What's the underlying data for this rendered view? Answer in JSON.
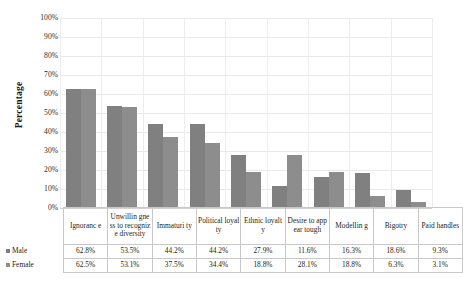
{
  "chart_data": {
    "type": "bar",
    "title": "",
    "xlabel": "",
    "ylabel": "Percentage",
    "ylim": [
      0,
      100
    ],
    "ytick_labels": [
      "100%",
      "90%",
      "80%",
      "70%",
      "60%",
      "50%",
      "40%",
      "30%",
      "20%",
      "10%",
      "0%"
    ],
    "ytick_values": [
      100,
      90,
      80,
      70,
      60,
      50,
      40,
      30,
      20,
      10,
      0
    ],
    "grid": true,
    "legend_position": "data-table-first-column",
    "categories": [
      "Ignoranc e",
      "Unwillin gness to recognize diversity",
      "Immaturi ty",
      "Political loyalty",
      "Ethnic loyalty",
      "Desire to appear tough",
      "Modellin g",
      "Bigotry",
      "Paid handles"
    ],
    "series": [
      {
        "name": "Male",
        "color": "#808080",
        "values": [
          62.8,
          53.5,
          44.2,
          44.2,
          27.9,
          11.6,
          16.3,
          18.6,
          9.3
        ],
        "labels": [
          "62.8%",
          "53.5%",
          "44.2%",
          "44.2%",
          "27.9%",
          "11.6%",
          "16.3%",
          "18.6%",
          "9.3%"
        ]
      },
      {
        "name": "Female",
        "color": "#8d8d8d",
        "values": [
          62.5,
          53.1,
          37.5,
          34.4,
          18.8,
          28.1,
          18.8,
          6.3,
          3.1
        ],
        "labels": [
          "62.5%",
          "53.1%",
          "37.5%",
          "34.4%",
          "18.8%",
          "28.1%",
          "18.8%",
          "6.3%",
          "3.1%"
        ]
      }
    ]
  }
}
